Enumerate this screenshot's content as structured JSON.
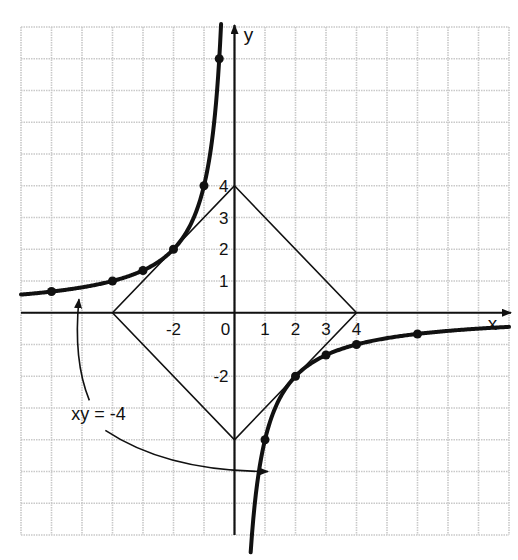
{
  "chart_data": {
    "type": "line",
    "title": "",
    "xlabel": "x",
    "ylabel": "y",
    "xlim": [
      -7,
      9
    ],
    "ylim": [
      -7,
      9
    ],
    "grid": true,
    "x_ticks": [
      {
        "value": -2,
        "label": "-2"
      },
      {
        "value": 0,
        "label": "0"
      },
      {
        "value": 1,
        "label": "1"
      },
      {
        "value": 2,
        "label": "2"
      },
      {
        "value": 3,
        "label": "3"
      },
      {
        "value": 4,
        "label": "4"
      }
    ],
    "y_ticks": [
      {
        "value": 1,
        "label": "1"
      },
      {
        "value": 2,
        "label": "2"
      },
      {
        "value": 3,
        "label": "3"
      },
      {
        "value": 4,
        "label": "4"
      },
      {
        "value": -2,
        "label": "-2"
      }
    ],
    "series": [
      {
        "name": "xy = -4 (left branch)",
        "equation": "xy = -4",
        "x_range": [
          -7,
          -0.44
        ],
        "points": [
          [
            -6,
            0.67
          ],
          [
            -4,
            1
          ],
          [
            -3,
            1.33
          ],
          [
            -2,
            2
          ],
          [
            -1,
            4
          ],
          [
            -0.5,
            8
          ]
        ]
      },
      {
        "name": "xy = -4 (right branch)",
        "equation": "xy = -4",
        "x_range": [
          0.53,
          9
        ],
        "points": [
          [
            1,
            -4
          ],
          [
            2,
            -2
          ],
          [
            3,
            -1.33
          ],
          [
            4,
            -1
          ],
          [
            6,
            -0.67
          ]
        ]
      },
      {
        "name": "|x| + |y| = 4",
        "type": "polygon",
        "vertices": [
          [
            0,
            4
          ],
          [
            4,
            0
          ],
          [
            0,
            -4
          ],
          [
            -4,
            0
          ]
        ]
      }
    ],
    "annotations": [
      {
        "text": "xy = -4",
        "position": [
          -4.3,
          -3.2
        ],
        "arrows_to": [
          [
            -5.1,
            0.55
          ],
          [
            1.1,
            -5.0
          ]
        ]
      }
    ],
    "legend": "none"
  }
}
